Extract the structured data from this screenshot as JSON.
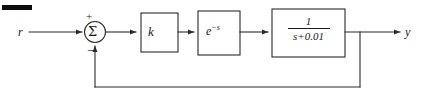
{
  "diagram": {
    "type": "control-system-block-diagram",
    "stroke_color": "#2b2b2b",
    "text_color": "#1a1a1a",
    "background": "#ffffff",
    "signals": {
      "input_label": "r",
      "output_label": "y"
    },
    "summing_junction": {
      "symbol": "Σ",
      "positive_sign": "+",
      "negative_sign": "−",
      "positive_input": "r",
      "negative_input": "feedback"
    },
    "blocks": [
      {
        "id": "gain",
        "label": "k",
        "kind": "gain"
      },
      {
        "id": "delay",
        "label_base": "e",
        "label_exponent": "−s",
        "label_plain": "e^(-s)",
        "kind": "time-delay"
      },
      {
        "id": "plant",
        "numerator": "1",
        "denominator": "s+0.01",
        "label_plain": "1/(s+0.01)",
        "kind": "transfer-function"
      }
    ],
    "feedback": {
      "path": "unity",
      "description": "output branch returns to summing junction negative input"
    },
    "artifact": {
      "name": "scan-bar",
      "description": "black scan mark at top-left"
    }
  }
}
